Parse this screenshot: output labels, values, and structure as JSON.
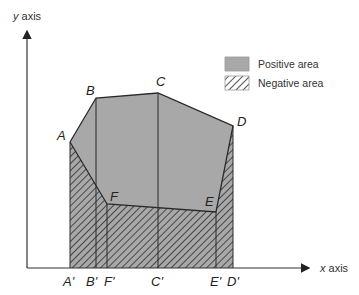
{
  "axes": {
    "y_label_var": "y",
    "y_label_word": " axis",
    "x_label_var": "x",
    "x_label_word": " axis"
  },
  "points": {
    "A": "A",
    "B": "B",
    "C": "C",
    "D": "D",
    "E": "E",
    "F": "F"
  },
  "projections": {
    "A": "A'",
    "B": "B'",
    "F": "F'",
    "C": "C'",
    "E": "E'",
    "D": "D'"
  },
  "legend": {
    "positive_label": "Positive area",
    "negative_label": "Negative area"
  },
  "colors": {
    "positive_fill": "#a8a8a8",
    "negative_hatch": "#3a3a3a",
    "outline": "#2a2a2a",
    "axis": "#333333"
  }
}
